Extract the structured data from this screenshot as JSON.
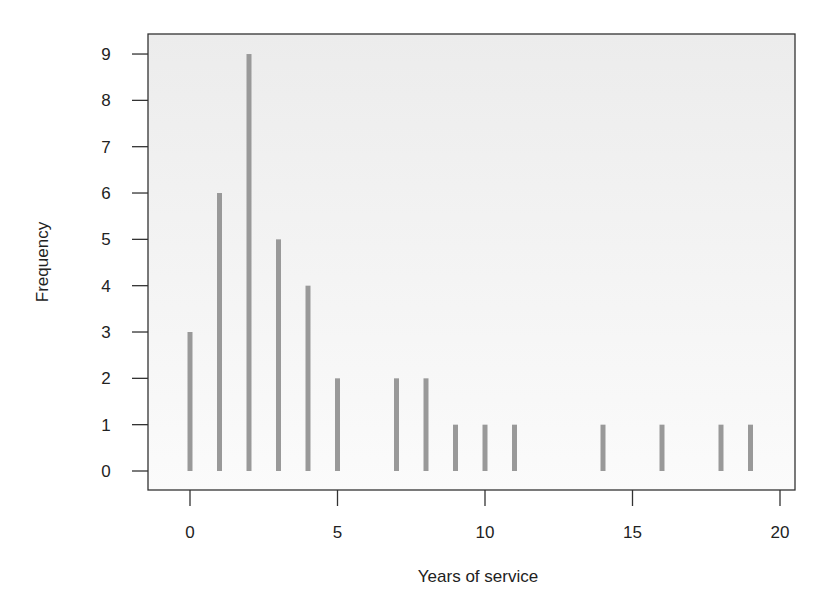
{
  "chart_data": {
    "type": "bar",
    "subtype": "frequency-spike",
    "title": "",
    "xlabel": "Years of service",
    "ylabel": "Frequency",
    "x": [
      0,
      1,
      2,
      3,
      4,
      5,
      7,
      8,
      9,
      10,
      11,
      14,
      16,
      18,
      19
    ],
    "values": [
      3,
      6,
      9,
      5,
      4,
      2,
      2,
      2,
      1,
      1,
      1,
      1,
      1,
      1,
      1
    ],
    "xlim": [
      -1.4,
      20.5
    ],
    "ylim": [
      -0.4,
      9.4
    ],
    "xticks": [
      0,
      5,
      10,
      15,
      20
    ],
    "yticks": [
      0,
      1,
      2,
      3,
      4,
      5,
      6,
      7,
      8,
      9
    ],
    "grid": false,
    "legend": null,
    "colors": {
      "bar": "#999999",
      "axis": "#333333",
      "plot_bg_top": "#ececec",
      "plot_bg_bottom": "#fbfbfb"
    }
  }
}
